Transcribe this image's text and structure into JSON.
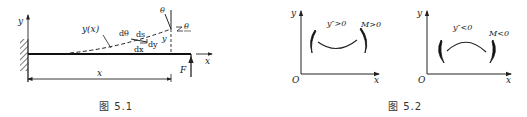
{
  "figure_1": {
    "caption": "图 5.1",
    "labels": {
      "y_axis": "y",
      "x_axis": "x",
      "deflection_curve": "y(x)",
      "d_theta": "dθ",
      "ds": "ds",
      "dy": "dy",
      "dx": "dx",
      "theta_top": "θ",
      "theta_right": "θ",
      "y_deflection": "y",
      "force": "F",
      "span": "x"
    }
  },
  "figure_2": {
    "caption": "图 5.2",
    "left_panel": {
      "y_axis": "y",
      "x_axis": "x",
      "origin": "O",
      "curvature_label": "y″>0",
      "moment_label": "M>0"
    },
    "right_panel": {
      "y_axis": "y",
      "x_axis": "x",
      "origin": "O",
      "curvature_label": "y″<0",
      "moment_label": "M<0"
    }
  }
}
